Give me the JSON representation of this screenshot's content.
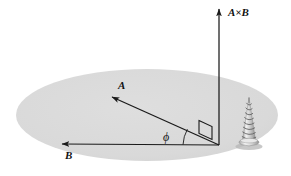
{
  "figure": {
    "background_color": "#ffffff",
    "plane": {
      "name": "plane-of-A-and-B",
      "shape": "ellipse",
      "fill_color": "#d9d9d9",
      "center_x": 147,
      "center_y": 115,
      "radius_x": 131,
      "radius_y": 46
    },
    "line_color": "#1a1a1a",
    "origin": {
      "x": 219,
      "y": 145
    },
    "vectors": [
      {
        "id": "vector-a",
        "label": "A",
        "tip_x": 112,
        "tip_y": 97,
        "tail_x": 219,
        "tail_y": 145,
        "label_x": 118,
        "label_y": 89,
        "label_size": 11
      },
      {
        "id": "vector-b",
        "label": "B",
        "tip_x": 62,
        "tip_y": 144,
        "tail_x": 219,
        "tail_y": 145,
        "label_x": 65,
        "label_y": 159,
        "label_size": 11
      },
      {
        "id": "vector-a-cross-b",
        "label": "A×B",
        "tip_x": 219,
        "tip_y": 9,
        "tail_x": 219,
        "tail_y": 145,
        "label_x": 228,
        "label_y": 16,
        "label_size": 11
      }
    ],
    "angle": {
      "id": "angle-phi",
      "symbol": "ϕ",
      "label_x": 163,
      "label_y": 141,
      "label_size": 12,
      "arc_radius": 36
    },
    "right_angle_marker": {
      "id": "right-angle-marker",
      "x": 199,
      "y": 120,
      "size": 13
    },
    "screw": {
      "id": "right-hand-rule-screw",
      "tip_x": 249,
      "tip_y": 97,
      "base_x": 249,
      "base_y": 145,
      "turns": 9,
      "body_color": "#c9c9c9",
      "outline_color": "#6e6e6e"
    }
  }
}
